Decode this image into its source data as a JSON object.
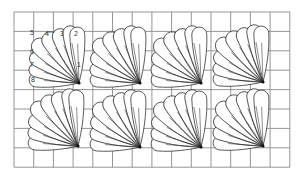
{
  "figure": {
    "grid": {
      "x0": 14,
      "y0": 12,
      "cols": 14,
      "rows": 8,
      "cell_w": 19.7,
      "cell_h": 19.4,
      "color": "#8a8a8a"
    },
    "line_color": "#2a2a2a",
    "fans": [
      {
        "fx": 79,
        "fy": 83
      },
      {
        "fx": 140,
        "fy": 83
      },
      {
        "fx": 201,
        "fy": 83
      },
      {
        "fx": 263,
        "fy": 82
      },
      {
        "fx": 78,
        "fy": 146
      },
      {
        "fx": 140,
        "fy": 147
      },
      {
        "fx": 201,
        "fy": 147
      },
      {
        "fx": 263,
        "fy": 146
      }
    ],
    "petals": [
      {
        "angle": 92,
        "length": 56,
        "width": 7.5
      },
      {
        "angle": 100,
        "length": 58,
        "width": 7.5
      },
      {
        "angle": 112,
        "length": 58,
        "width": 8
      },
      {
        "angle": 124,
        "length": 60,
        "width": 8.5
      },
      {
        "angle": 137,
        "length": 62,
        "width": 8.5
      },
      {
        "angle": 150,
        "length": 56,
        "width": 7.5
      },
      {
        "angle": 163,
        "length": 52,
        "width": 7
      },
      {
        "angle": 176,
        "length": 50,
        "width": 7
      }
    ],
    "petal_labels": [
      {
        "text": "1",
        "x": 77,
        "y": 67
      },
      {
        "text": "2",
        "x": 74,
        "y": 36
      },
      {
        "text": "3",
        "x": 60,
        "y": 36
      },
      {
        "text": "4",
        "x": 45,
        "y": 36
      },
      {
        "text": "5",
        "x": 30,
        "y": 35
      },
      {
        "text": "6",
        "x": 30,
        "y": 54
      },
      {
        "text": "7",
        "x": 30,
        "y": 67
      },
      {
        "text": "8",
        "x": 31,
        "y": 82
      }
    ]
  }
}
